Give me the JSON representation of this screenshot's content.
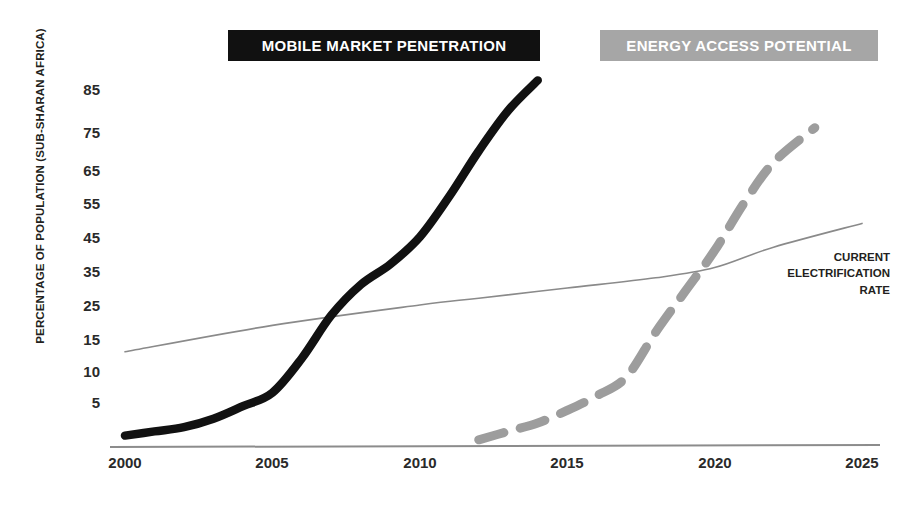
{
  "chart_data": {
    "type": "line",
    "title": "",
    "xlabel": "",
    "ylabel": "PERCENTAGE OF POPULATION (SUB-SHARAN AFRICA)",
    "xlim": [
      2000,
      2025
    ],
    "ylim": [
      0,
      90
    ],
    "grid": false,
    "x_ticks": [
      "2000",
      "2005",
      "2010",
      "2015",
      "2020",
      "2025"
    ],
    "y_ticks": [
      "5",
      "10",
      "15",
      "25",
      "35",
      "45",
      "55",
      "65",
      "75",
      "85"
    ],
    "legend_position": "top-banners",
    "series": [
      {
        "name": "MOBILE MARKET PENETRATION",
        "style": "solid-thick",
        "color": "#111111",
        "x": [
          2000,
          2001,
          2002,
          2003,
          2004,
          2005,
          2006,
          2007,
          2008,
          2009,
          2010,
          2011,
          2012,
          2013,
          2014
        ],
        "values": [
          1,
          1.5,
          2,
          3,
          4.5,
          6.5,
          12,
          22,
          31,
          37,
          45,
          57,
          70,
          80,
          87
        ]
      },
      {
        "name": "ENERGY ACCESS POTENTIAL",
        "style": "dashed-thick",
        "color": "#9d9d9d",
        "x": [
          2012,
          2013,
          2014,
          2015,
          2016,
          2017,
          2018,
          2019,
          2020,
          2021,
          2022,
          2023.4
        ],
        "values": [
          0.5,
          1.5,
          2.5,
          4,
          6,
          9,
          17,
          29,
          41,
          55,
          67,
          76
        ]
      },
      {
        "name": "CURRENT ELECTRIFICATION RATE",
        "style": "solid-thin",
        "color": "#8a8a8a",
        "x": [
          2000,
          2005,
          2010,
          2012,
          2015,
          2018,
          2020,
          2022,
          2025
        ],
        "values": [
          13,
          19,
          25,
          27,
          30,
          33,
          36,
          42,
          49
        ]
      }
    ],
    "annotations": [
      {
        "text_lines": [
          "CURRENT",
          "ELECTRIFICATION",
          "RATE"
        ],
        "attached_series": "CURRENT ELECTRIFICATION RATE"
      }
    ]
  },
  "axes": {
    "y_title": "PERCENTAGE OF POPULATION (SUB-SHARAN AFRICA)",
    "y_ticks": [
      {
        "label": "85",
        "y": 89
      },
      {
        "label": "75",
        "y": 132
      },
      {
        "label": "65",
        "y": 170
      },
      {
        "label": "55",
        "y": 203
      },
      {
        "label": "45",
        "y": 237
      },
      {
        "label": "35",
        "y": 271
      },
      {
        "label": "25",
        "y": 305
      },
      {
        "label": "15",
        "y": 339
      },
      {
        "label": "10",
        "y": 371
      },
      {
        "label": "5",
        "y": 402
      }
    ],
    "x_ticks": [
      {
        "label": "2000",
        "x": 125
      },
      {
        "label": "2005",
        "x": 272
      },
      {
        "label": "2010",
        "x": 420
      },
      {
        "label": "2015",
        "x": 567
      },
      {
        "label": "2020",
        "x": 715
      },
      {
        "label": "2025",
        "x": 862
      }
    ],
    "baseline_color": "#8c8c8c"
  },
  "banners": {
    "mobile": {
      "label": "MOBILE MARKET PENETRATION",
      "background": "#111111",
      "text_color": "#ffffff"
    },
    "energy": {
      "label": "ENERGY ACCESS POTENTIAL",
      "background": "#a6a6a6",
      "text_color": "#ffffff"
    }
  },
  "annotation": {
    "line1": "CURRENT",
    "line2": "ELECTRIFICATION",
    "line3": "RATE"
  },
  "caption": {
    "text": " "
  },
  "colors": {
    "mobile_line": "#111111",
    "energy_line": "#9d9d9d",
    "electrification_line": "#8a8a8a",
    "axis": "#8c8c8c",
    "text": "#231f20"
  }
}
